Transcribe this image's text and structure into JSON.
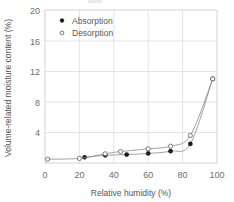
{
  "chart_data": {
    "type": "line",
    "title": "",
    "xlabel": "Relative humidity (%)",
    "ylabel": "Volume-related moisture content (%)",
    "xlim": [
      0,
      100
    ],
    "ylim": [
      0,
      20
    ],
    "xticks": [
      0,
      20,
      40,
      60,
      80,
      100
    ],
    "yticks": [
      4,
      8,
      12,
      16,
      20
    ],
    "grid": true,
    "legend_position": "top-left",
    "series": [
      {
        "name": "Absorption",
        "marker": "filled-circle",
        "x": [
          23,
          35,
          47.5,
          60,
          73,
          84.5,
          97.5
        ],
        "y": [
          0.75,
          1.0,
          1.1,
          1.25,
          1.55,
          2.5,
          11.0
        ]
      },
      {
        "name": "Desorption",
        "marker": "open-circle",
        "x": [
          1.5,
          20,
          35,
          44,
          60,
          73,
          84.5,
          97.5
        ],
        "y": [
          0.5,
          0.6,
          1.2,
          1.5,
          1.85,
          2.2,
          3.6,
          11.0
        ]
      }
    ]
  },
  "legend": {
    "items": [
      {
        "label": "Absorption",
        "marker": "filled-circle"
      },
      {
        "label": "Desorption",
        "marker": "open-circle"
      }
    ]
  },
  "axes": {
    "x_title": "Relative humidity (%)",
    "y_title": "Volume-related moisture content (%)",
    "x_tick_labels": [
      "0",
      "20",
      "40",
      "60",
      "80",
      "100"
    ],
    "y_tick_labels": [
      "20",
      "16",
      "12",
      "8",
      "4"
    ]
  },
  "colors": {
    "grid": "#d8d8d8",
    "frame": "#c9c9c9",
    "curve": "#8a8a8a",
    "absorption_marker": "#1a1a1a",
    "desorption_marker": "#5a5a5a",
    "text": "#5a5a5a",
    "background": "#ffffff"
  }
}
